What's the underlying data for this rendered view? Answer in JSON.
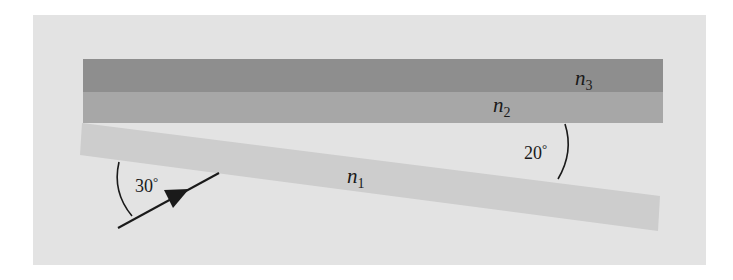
{
  "figure": {
    "colors": {
      "page": "#ffffff",
      "panel": "#e3e3e3",
      "layer_n3": "#8e8e8e",
      "layer_n2": "#a7a7a7",
      "layer_n1": "#cdcdcd",
      "ink": "#1a1a1a"
    }
  },
  "layers": [
    {
      "id": "n3",
      "base": "n",
      "sub": "3"
    },
    {
      "id": "n2",
      "base": "n",
      "sub": "2"
    },
    {
      "id": "n1",
      "base": "n",
      "sub": "1"
    }
  ],
  "angles": {
    "incident": {
      "value": "30",
      "unit": "°"
    },
    "wedge": {
      "value": "20",
      "unit": "°"
    }
  }
}
